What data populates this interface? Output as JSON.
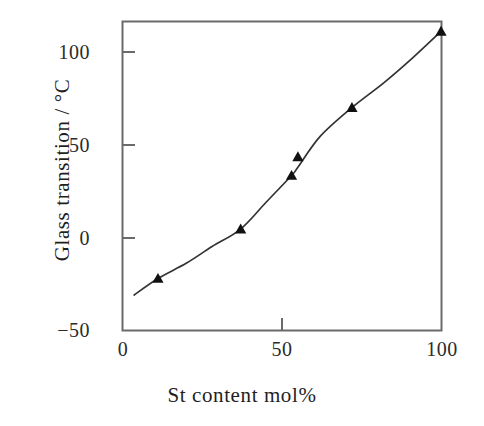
{
  "chart_data": {
    "type": "line",
    "title": "",
    "xlabel": "St content mol%",
    "ylabel": "Glass transition / °C",
    "xlim": [
      0,
      104
    ],
    "ylim": [
      -50,
      112
    ],
    "xticks": [
      0,
      50,
      100
    ],
    "xticklabels": [
      "0",
      "50",
      "100"
    ],
    "yticks": [
      -50,
      0,
      50,
      100
    ],
    "yticklabels": [
      "−50",
      "0",
      "50",
      "100"
    ],
    "grid": false,
    "legend": null,
    "marker": "triangle-up",
    "marker_color": "#111111",
    "line_color": "#333333",
    "frame_color": "#555555",
    "background": "#ffffff",
    "series": [
      {
        "name": "Glass transition temperature",
        "x": [
          11,
          37,
          53,
          55,
          72,
          100
        ],
        "y": [
          -25,
          -1,
          25,
          34,
          58,
          95
        ]
      }
    ],
    "curve_x": [
      3.5,
      11,
      20,
      28,
      37,
      45,
      53,
      55,
      62,
      72,
      82,
      91,
      100
    ],
    "curve_y": [
      -33,
      -25,
      -17.5,
      -9.5,
      -1,
      12,
      25,
      29,
      44,
      58,
      70,
      82,
      95
    ]
  },
  "axis": {
    "x_title": "St content mol%",
    "y_title": "Glass transition / °C"
  },
  "ticks": {
    "y": [
      {
        "label": "100",
        "value": 100
      },
      {
        "label": "50",
        "value": 50
      },
      {
        "label": "0",
        "value": 0
      },
      {
        "label": "−50",
        "value": -50
      }
    ],
    "x": [
      {
        "label": "0",
        "value": 0
      },
      {
        "label": "50",
        "value": 50
      },
      {
        "label": "100",
        "value": 100
      }
    ]
  }
}
